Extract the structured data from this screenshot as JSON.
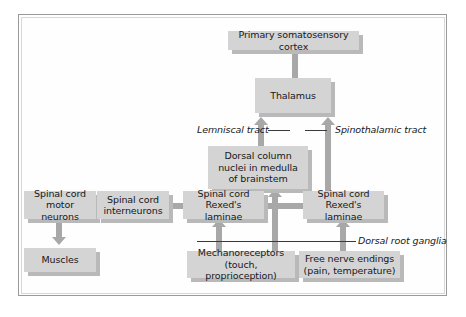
{
  "diagram": {
    "colors": {
      "node_fill": "#d4d4d4",
      "node_shadow": "#b9b9b9",
      "arrow": "#a8a8a8",
      "text": "#16181a",
      "frame_border": "#9a9a9a",
      "background": "#ffffff"
    },
    "nodes": [
      {
        "id": "cortex",
        "label": "Primary somatosensory cortex"
      },
      {
        "id": "thalamus",
        "label": "Thalamus"
      },
      {
        "id": "dorsal_column",
        "label": "Dorsal column\nnuclei in medulla\nof brainstem"
      },
      {
        "id": "motor_neurons",
        "label": "Spinal cord\nmotor neurons"
      },
      {
        "id": "interneurons",
        "label": "Spinal cord\ninterneurons"
      },
      {
        "id": "rexed_left",
        "label": "Spinal cord\nRexed's laminae"
      },
      {
        "id": "rexed_right",
        "label": "Spinal cord\nRexed's laminae"
      },
      {
        "id": "muscles",
        "label": "Muscles"
      },
      {
        "id": "mechano",
        "label": "Mechanoreceptors\n(touch, proprioception)"
      },
      {
        "id": "free_nerve",
        "label": "Free nerve endings\n(pain, temperature)"
      }
    ],
    "annotations": [
      {
        "id": "lemniscal",
        "label": "Lemniscal tract"
      },
      {
        "id": "spinothalamic",
        "label": "Spinothalamic tract"
      },
      {
        "id": "dorsal_root",
        "label": "Dorsal root ganglia"
      }
    ]
  }
}
